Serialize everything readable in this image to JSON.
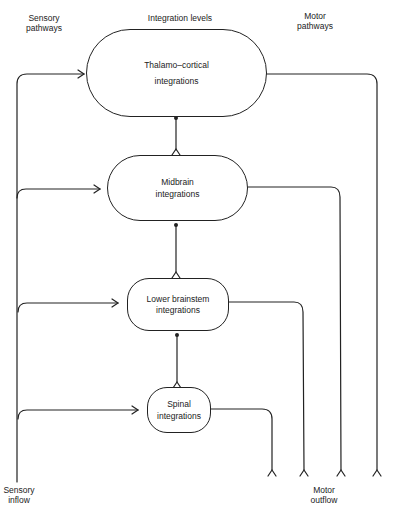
{
  "column_headers": {
    "sensory": [
      "Sensory",
      "pathways"
    ],
    "integration": "Integration levels",
    "motor": [
      "Motor",
      "pathways"
    ]
  },
  "levels": [
    {
      "id": "thalamo-cortical",
      "lines": [
        "Thalamo–cortical",
        "integrations"
      ]
    },
    {
      "id": "midbrain",
      "lines": [
        "Midbrain",
        "integrations"
      ]
    },
    {
      "id": "lower-brainstem",
      "lines": [
        "Lower brainstem",
        "integrations"
      ]
    },
    {
      "id": "spinal",
      "lines": [
        "Spinal",
        "integrations"
      ]
    }
  ],
  "footer_labels": {
    "sensory_inflow": [
      "Sensory",
      "inflow"
    ],
    "motor_outflow": [
      "Motor",
      "outflow"
    ]
  },
  "colors": {
    "line": "#222222",
    "background": "#ffffff"
  }
}
